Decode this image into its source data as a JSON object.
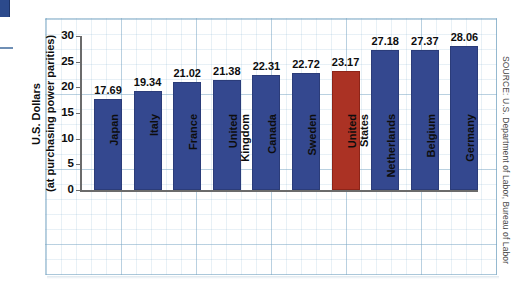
{
  "chart_data": {
    "type": "bar",
    "title": "",
    "xlabel": "",
    "ylabel": "U.S. Dollars (at purchasing power parities)",
    "ylabel_line1": "U.S. Dollars",
    "ylabel_line2": "(at purchasing power parities)",
    "ylim": [
      0,
      30
    ],
    "yticks": [
      30,
      25,
      20,
      15,
      10,
      5,
      0
    ],
    "grid": true,
    "legend": "none",
    "categories": [
      "Japan",
      "Italy",
      "France",
      "United Kingdom",
      "Canada",
      "Sweden",
      "United States",
      "Netherlands",
      "Belgium",
      "Germany"
    ],
    "category_lines": [
      [
        "Japan"
      ],
      [
        "Italy"
      ],
      [
        "France"
      ],
      [
        "United",
        "Kingdom"
      ],
      [
        "Canada"
      ],
      [
        "Sweden"
      ],
      [
        "United",
        "States"
      ],
      [
        "Netherlands"
      ],
      [
        "Belgium"
      ],
      [
        "Germany"
      ]
    ],
    "values": [
      17.69,
      19.34,
      21.02,
      21.38,
      22.31,
      22.72,
      23.17,
      27.18,
      27.37,
      28.06
    ],
    "value_labels": [
      "17.69",
      "19.34",
      "21.02",
      "21.38",
      "22.31",
      "22.72",
      "23.17",
      "27.18",
      "27.37",
      "28.06"
    ],
    "highlight_index": 6,
    "bar_color": "#34488f",
    "highlight_color": "#ab3224",
    "grid_color": "#78a5c3"
  },
  "source": {
    "text": "SOURCE: U.S. Department of Labor, Bureau of Labor"
  },
  "icons": {
    "corner_square": "blue-square-mark",
    "left_tick": "tick-mark"
  }
}
